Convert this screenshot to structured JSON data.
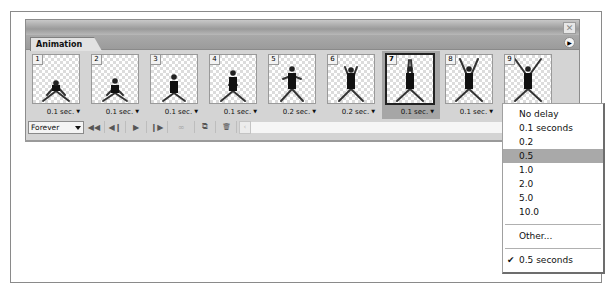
{
  "panel": {
    "tab_label": "Animation",
    "close_icon": "close-icon",
    "menu_icon": "panel-menu-arrow-icon"
  },
  "frames": [
    {
      "number": "1",
      "delay": "0.1 sec.",
      "selected": false,
      "pose": 1
    },
    {
      "number": "2",
      "delay": "0.1 sec.",
      "selected": false,
      "pose": 2
    },
    {
      "number": "3",
      "delay": "0.1 sec.",
      "selected": false,
      "pose": 3
    },
    {
      "number": "4",
      "delay": "0.1 sec.",
      "selected": false,
      "pose": 4
    },
    {
      "number": "5",
      "delay": "0.2 sec.",
      "selected": false,
      "pose": 5
    },
    {
      "number": "6",
      "delay": "0.2 sec.",
      "selected": false,
      "pose": 6
    },
    {
      "number": "7",
      "delay": "0.1 sec.",
      "selected": true,
      "pose": 7
    },
    {
      "number": "8",
      "delay": "0.1 sec.",
      "selected": false,
      "pose": 8
    },
    {
      "number": "9",
      "delay": "",
      "selected": false,
      "pose": 9
    }
  ],
  "toolbar": {
    "loop_value": "Forever",
    "buttons": [
      {
        "name": "first-frame-button",
        "glyph": "◀◀"
      },
      {
        "name": "previous-frame-button",
        "glyph": "◀❙"
      },
      {
        "name": "play-button",
        "glyph": "▶"
      },
      {
        "name": "next-frame-button",
        "glyph": "❙▶"
      },
      {
        "name": "tween-button",
        "glyph": "∞"
      },
      {
        "name": "duplicate-frame-button",
        "glyph": "⧉"
      },
      {
        "name": "delete-frame-button",
        "glyph": "🗑"
      }
    ]
  },
  "delay_menu": {
    "items": [
      "No delay",
      "0.1 seconds",
      "0.2",
      "0.5",
      "1.0",
      "2.0",
      "5.0",
      "10.0"
    ],
    "highlighted": "0.5",
    "other": "Other...",
    "current": "0.5 seconds",
    "check_glyph": "✔"
  }
}
